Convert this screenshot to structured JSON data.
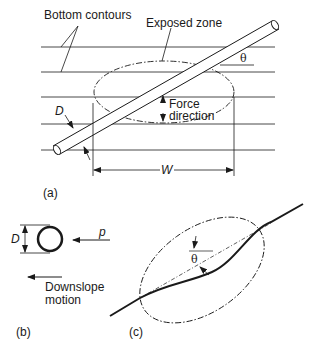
{
  "panel_a": {
    "label": "(a)",
    "bottom_contours_label": "Bottom contours",
    "exposed_zone_label": "Exposed zone",
    "theta_label": "θ",
    "diameter_label": "D",
    "force_direction_line1": "Force",
    "force_direction_line2": "direction",
    "width_label": "W"
  },
  "panel_b": {
    "label": "(b)",
    "diameter_label": "D",
    "force_label": "p",
    "downslope_line1": "Downslope",
    "downslope_line2": "motion"
  },
  "panel_c": {
    "label": "(c)",
    "theta_label": "θ"
  },
  "colors": {
    "line": "#1a1a1a",
    "background": "#ffffff"
  }
}
